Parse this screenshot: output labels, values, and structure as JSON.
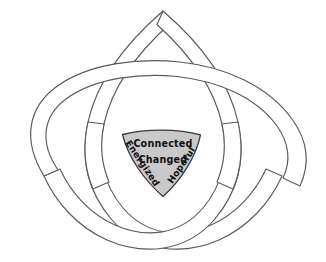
{
  "diagram": {
    "name": "triquetra-trinity-knot",
    "type": "interlaced-celtic-knot",
    "background_color": "#ffffff",
    "band_stroke_color": "#5a5a5a",
    "band_fill_color": "#ffffff",
    "center_fill_color": "#c9c9c9",
    "center_stroke_color": "#3a3a3a",
    "text_color": "#101010",
    "loop_count": 3,
    "loops": [
      {
        "name": "top-loop",
        "label": ""
      },
      {
        "name": "lower-left-loop",
        "label": ""
      },
      {
        "name": "lower-right-loop",
        "label": ""
      }
    ],
    "center": {
      "name": "center-triangle",
      "shape": "curved-triangle",
      "words": [
        {
          "id": "connected",
          "text": "Connected",
          "rotation": 0
        },
        {
          "id": "changed",
          "text": "Changed",
          "rotation": 0
        },
        {
          "id": "energized",
          "text": "Energized",
          "rotation": 56
        },
        {
          "id": "hopeful",
          "text": "Hopeful",
          "rotation": -56
        }
      ]
    }
  }
}
